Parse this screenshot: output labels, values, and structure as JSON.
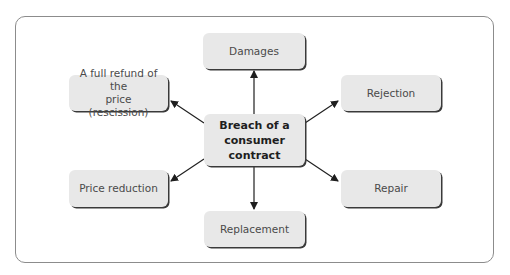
{
  "diagram": {
    "type": "hub-and-spoke",
    "center": {
      "label": "Breach of a consumer contract",
      "lines": [
        "Breach of a",
        "consumer",
        "contract"
      ]
    },
    "outcomes": [
      {
        "id": "damages",
        "label": "Damages",
        "position": "top"
      },
      {
        "id": "rejection",
        "label": "Rejection",
        "position": "upper-right"
      },
      {
        "id": "repair",
        "label": "Repair",
        "position": "lower-right"
      },
      {
        "id": "replacement",
        "label": "Replacement",
        "position": "bottom"
      },
      {
        "id": "price-reduction",
        "label": "Price reduction",
        "position": "lower-left"
      },
      {
        "id": "full-refund",
        "label": "A full refund of the price (rescission)",
        "lines": [
          "A full refund of the",
          "price (rescission)"
        ],
        "position": "upper-left"
      }
    ],
    "colors": {
      "box_fill": "#e8e8e8",
      "box_shadow": "#3a3a3a",
      "arrow": "#1e1e1e",
      "frame": "#8c8c8c"
    }
  }
}
